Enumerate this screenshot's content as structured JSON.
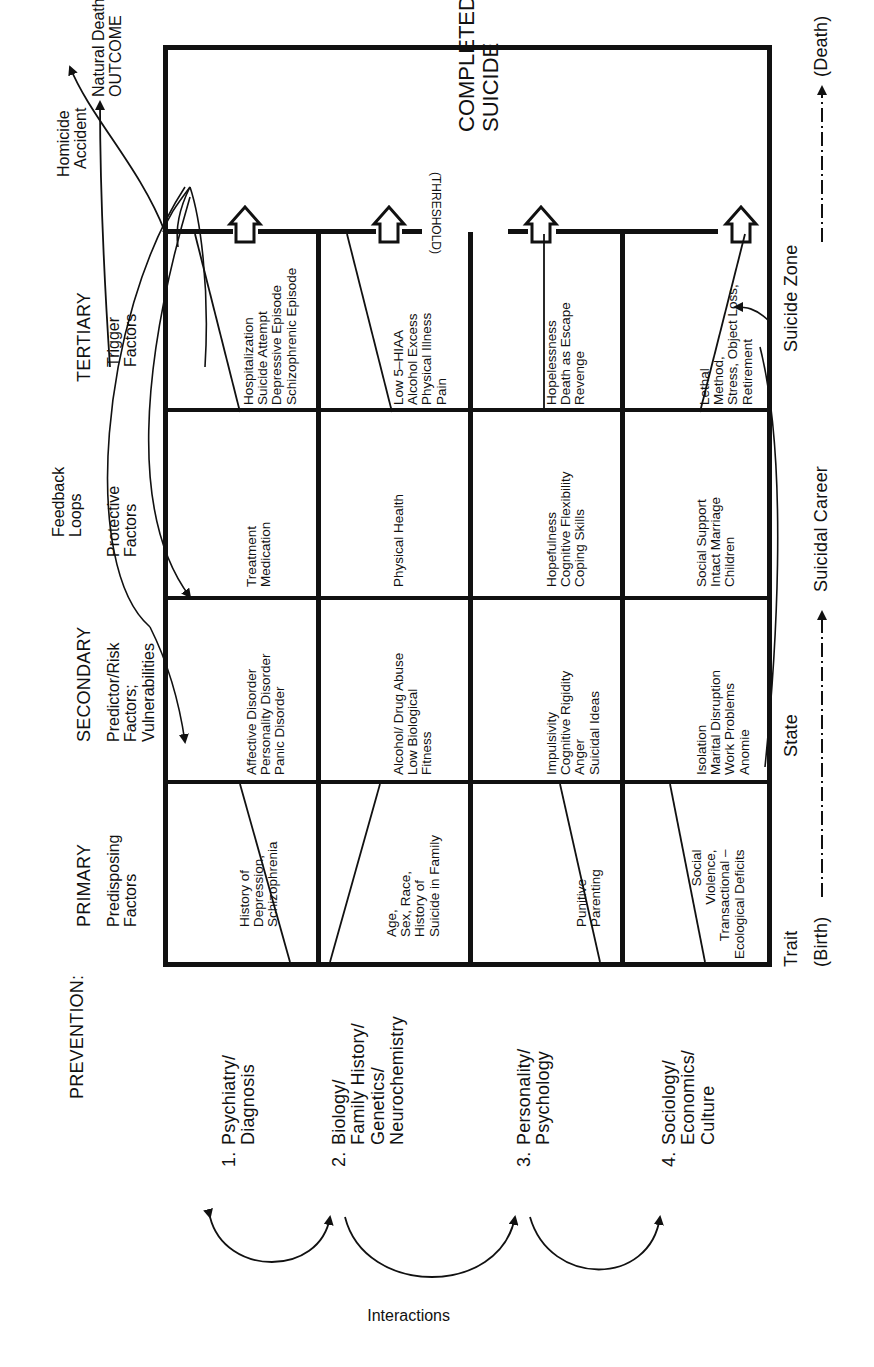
{
  "prevention": {
    "title": "PREVENTION:",
    "domains": [
      {
        "number": "1.",
        "label": "Psychiatry/\nDiagnosis"
      },
      {
        "number": "2.",
        "label": "Biology/\nFamily History/\nGenetics/\nNeurochemistry"
      },
      {
        "number": "3.",
        "label": "Personality/\nPsychology"
      },
      {
        "number": "4.",
        "label": "Sociology/\nEconomics/\nCulture"
      }
    ],
    "interactions_label": "Interactions"
  },
  "columns": [
    {
      "level": "PRIMARY",
      "label": "Predisposing\nFactors"
    },
    {
      "level": "SECONDARY",
      "label": "Predictor/Risk\nFactors;\nVulnerabilities"
    },
    {
      "level": "",
      "label": "Protective\nFactors"
    },
    {
      "level": "TERTIARY",
      "label": "Trigger\nFactors"
    }
  ],
  "feedback_label": "Feedback\nLoops",
  "outcome": {
    "items": [
      "Homicide",
      "Accident",
      "Natural Death"
    ],
    "label": "OUTCOME",
    "text_block_1": "Homicide\n  Accident",
    "text_block_2": "Natural Death\nOUTCOME"
  },
  "completed_suicide": "COMPLETED\nSUICIDE",
  "threshold_label": "(THRESHOLD)",
  "rows": [
    {
      "domain": "Psychiatry",
      "primary": "History of\nDepression,\nSchizophrenia",
      "secondary": "Affective Disorder\nPersonality Disorder\nPanic Disorder",
      "protective": "Treatment\nMedication",
      "trigger": "Hospitalization\nSuicide Attempt\nDepressive Episode\nSchizophrenic Episode"
    },
    {
      "domain": "Biology",
      "primary": "Age,\nSex, Race,\nHistory of\nSuicide in Family",
      "secondary": "Alcohol/ Drug Abuse\nLow Biological\nFitness",
      "protective": "Physical Health",
      "trigger": "Low 5–HIAA\nAlcohol Excess\nPhysical Illness\nPain"
    },
    {
      "domain": "Personality",
      "primary": "Punitive\nParenting",
      "secondary": "Impulsivity\nCognitive Rigidity\nAnger\nSuicidal Ideas",
      "protective": "Hopefulness\nCognitive Flexibility\nCoping Skills",
      "trigger": "Hopelessness\nDeath as Escape\nRevenge"
    },
    {
      "domain": "Sociology",
      "primary": "Social\nViolence,\nTransactional –\nEcological Deficits",
      "secondary": "Isolation\nMarital Disruption\nWork Problems\nAnomie",
      "protective": "Social Support\nIntact Marriage\nChildren",
      "trigger": "Lethal\nMethod,\nStress, Object Loss,\nRetirement"
    }
  ],
  "timeline": {
    "trait": "Trait",
    "state": "State",
    "suicide_zone": "Suicide Zone",
    "birth": "(Birth)",
    "career": "Suicidal Career",
    "death": "(Death)"
  }
}
